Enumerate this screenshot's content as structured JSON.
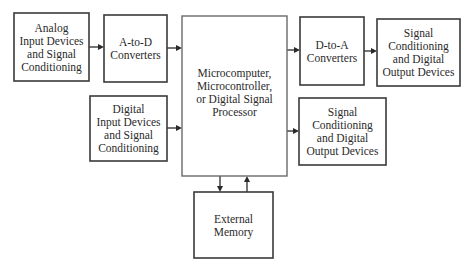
{
  "diagram": {
    "blocks": [
      {
        "id": "analog-input",
        "name": "block-analog-input",
        "x": 14,
        "y": 13,
        "w": 75,
        "h": 68,
        "lines": [
          "Analog",
          "Input Devices",
          "and Signal",
          "Conditioning"
        ]
      },
      {
        "id": "a-to-d",
        "name": "block-a-to-d-converters",
        "x": 104,
        "y": 15,
        "w": 63,
        "h": 67,
        "lines": [
          "A-to-D",
          "Converters"
        ]
      },
      {
        "id": "digital-input",
        "name": "block-digital-input",
        "x": 90,
        "y": 96,
        "w": 77,
        "h": 65,
        "lines": [
          "Digital",
          "Input Devices",
          "and Signal",
          "Conditioning"
        ]
      },
      {
        "id": "processor",
        "name": "block-processor",
        "x": 182,
        "y": 16,
        "w": 105,
        "h": 160,
        "lines": [
          "Microcomputer,",
          "Microcontroller,",
          "or Digital Signal",
          "Processor"
        ],
        "main": true
      },
      {
        "id": "d-to-a",
        "name": "block-d-to-a-converters",
        "x": 300,
        "y": 17,
        "w": 64,
        "h": 68,
        "lines": [
          "D-to-A",
          "Converters"
        ]
      },
      {
        "id": "analog-output",
        "name": "block-signal-conditioning-output-top",
        "x": 377,
        "y": 19,
        "w": 83,
        "h": 67,
        "lines": [
          "Signal",
          "Conditioning",
          "and Digital",
          "Output Devices"
        ]
      },
      {
        "id": "digital-output",
        "name": "block-signal-conditioning-output-bottom",
        "x": 299,
        "y": 98,
        "w": 87,
        "h": 67,
        "lines": [
          "Signal",
          "Conditioning",
          "and Digital",
          "Output Devices"
        ]
      },
      {
        "id": "memory",
        "name": "block-external-memory",
        "x": 194,
        "y": 192,
        "w": 79,
        "h": 66,
        "lines": [
          "External",
          "Memory"
        ]
      }
    ],
    "arrows": [
      {
        "name": "arrow-analog-to-adc",
        "x1": 89,
        "y1": 47,
        "x2": 104,
        "y2": 47
      },
      {
        "name": "arrow-adc-to-processor",
        "x1": 167,
        "y1": 48,
        "x2": 182,
        "y2": 48
      },
      {
        "name": "arrow-digital-input-to-processor",
        "x1": 167,
        "y1": 128,
        "x2": 182,
        "y2": 128
      },
      {
        "name": "arrow-processor-to-dac",
        "x1": 287,
        "y1": 50,
        "x2": 300,
        "y2": 50
      },
      {
        "name": "arrow-dac-to-output",
        "x1": 364,
        "y1": 51,
        "x2": 377,
        "y2": 51
      },
      {
        "name": "arrow-processor-to-digital-output",
        "x1": 287,
        "y1": 131,
        "x2": 299,
        "y2": 131
      },
      {
        "name": "arrow-processor-to-memory",
        "x1": 220,
        "y1": 176,
        "x2": 220,
        "y2": 192
      },
      {
        "name": "arrow-memory-to-processor",
        "x1": 247,
        "y1": 192,
        "x2": 247,
        "y2": 176
      }
    ]
  }
}
